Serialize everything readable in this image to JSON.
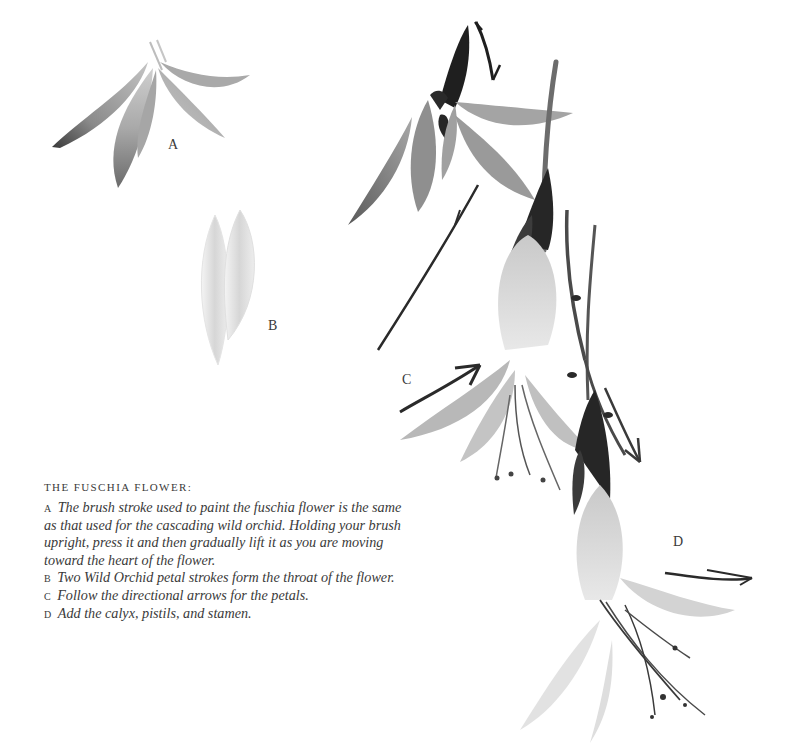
{
  "figure": {
    "labels": {
      "a": "A",
      "b": "B",
      "c": "C",
      "d": "D"
    },
    "ink_colors": {
      "dark": "#1e1e1e",
      "mid": "#6a6a6a",
      "light": "#b9b9b9",
      "wash": "#d9d9d9"
    }
  },
  "caption": {
    "title": "The Fuschia Flower:",
    "items": [
      {
        "letter": "A",
        "text": "The brush stroke used to paint the fuschia flower is the same as that used for the cascading wild orchid. Holding your brush upright, press it and then gradually lift it as you are moving toward the heart of the flower."
      },
      {
        "letter": "B",
        "text": "Two Wild Orchid petal strokes form the throat of the flower."
      },
      {
        "letter": "C",
        "text": "Follow the directional arrows for the petals."
      },
      {
        "letter": "D",
        "text": "Add the calyx, pistils, and stamen."
      }
    ]
  }
}
